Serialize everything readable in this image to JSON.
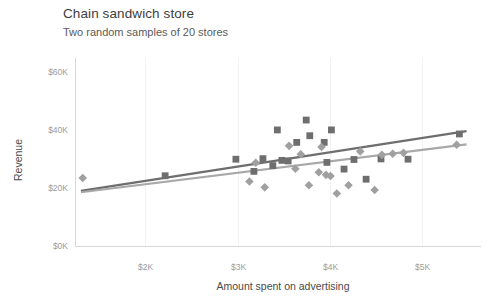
{
  "chart_data": {
    "type": "scatter",
    "title": "Chain sandwich store",
    "subtitle": "Two random samples of 20 stores",
    "xlabel": "Amount spent on advertising",
    "ylabel": "Revenue",
    "xlim": [
      1000,
      5500
    ],
    "ylim": [
      0,
      65000
    ],
    "xticks": [
      2000,
      3000,
      4000,
      5000
    ],
    "xtick_labels": [
      "$2K",
      "$3K",
      "$4K",
      "$5K"
    ],
    "yticks": [
      0,
      20000,
      40000,
      60000
    ],
    "ytick_labels": [
      "$0K",
      "$20K",
      "$40K",
      "$60K"
    ],
    "grid": "vertical-faint",
    "legend": "none",
    "series": [
      {
        "name": "Sample 1",
        "marker": "square",
        "color": "#6e6e6e",
        "points": [
          [
            1995,
            24400
          ],
          [
            2780,
            30100
          ],
          [
            2980,
            25900
          ],
          [
            3080,
            30300
          ],
          [
            3190,
            27900
          ],
          [
            3240,
            40200
          ],
          [
            3290,
            29700
          ],
          [
            3360,
            29500
          ],
          [
            3455,
            35900
          ],
          [
            3560,
            43600
          ],
          [
            3600,
            38200
          ],
          [
            3760,
            35900
          ],
          [
            3790,
            29000
          ],
          [
            3840,
            40200
          ],
          [
            3980,
            26700
          ],
          [
            4090,
            30000
          ],
          [
            4225,
            23200
          ],
          [
            4390,
            30200
          ],
          [
            4690,
            30100
          ],
          [
            5260,
            38800
          ]
        ]
      },
      {
        "name": "Sample 2",
        "marker": "diamond",
        "color": "#a0a0a0",
        "points": [
          [
            1080,
            23600
          ],
          [
            2930,
            22400
          ],
          [
            3000,
            28900
          ],
          [
            3100,
            20400
          ],
          [
            3370,
            34700
          ],
          [
            3440,
            26800
          ],
          [
            3500,
            31800
          ],
          [
            3590,
            21100
          ],
          [
            3700,
            25600
          ],
          [
            3730,
            34300
          ],
          [
            3780,
            24700
          ],
          [
            3830,
            24300
          ],
          [
            3900,
            18300
          ],
          [
            4030,
            21100
          ],
          [
            4160,
            32800
          ],
          [
            4320,
            19500
          ],
          [
            4400,
            31600
          ],
          [
            4520,
            32000
          ],
          [
            4640,
            32300
          ],
          [
            5230,
            35100
          ]
        ]
      }
    ],
    "trendlines": [
      {
        "name": "Sample 1 fit",
        "color": "#6e6e6e",
        "x0": 1060,
        "y0": 19200,
        "x1": 5340,
        "y1": 39800
      },
      {
        "name": "Sample 2 fit",
        "color": "#a8a8a8",
        "x0": 1060,
        "y0": 18700,
        "x1": 5340,
        "y1": 35200
      }
    ]
  }
}
